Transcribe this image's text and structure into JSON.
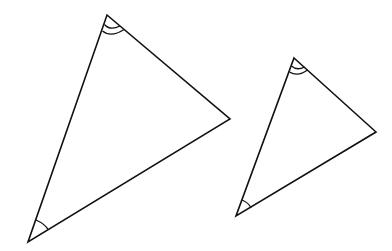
{
  "diagram": {
    "colors": {
      "stroke": "#111111",
      "background": "#ffffff"
    },
    "triangles": [
      {
        "name": "large",
        "vertices": {
          "top": [
            107,
            15
          ],
          "right": [
            230,
            119
          ],
          "bottom_left": [
            28,
            242
          ]
        },
        "angle_marks": {
          "top": "double-arc",
          "bottom_left": "single-arc"
        }
      },
      {
        "name": "small",
        "vertices": {
          "top": [
            294,
            58
          ],
          "right": [
            376,
            132
          ],
          "bottom_left": [
            236,
            216
          ]
        },
        "angle_marks": {
          "top": "double-arc",
          "bottom_left": "single-arc"
        }
      }
    ]
  }
}
